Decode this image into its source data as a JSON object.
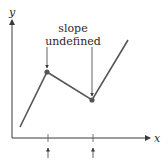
{
  "figure": {
    "axes": {
      "x_label": "x",
      "y_label": "y",
      "color": "#3a3a3a"
    },
    "annotation": {
      "line1": "slope",
      "line2": "undefined"
    },
    "curve": {
      "color": "#555555",
      "point_color": "#555555",
      "points": [
        {
          "x": 20,
          "y": 127
        },
        {
          "x": 47,
          "y": 72
        },
        {
          "x": 92,
          "y": 100
        },
        {
          "x": 128,
          "y": 40
        }
      ],
      "corners": [
        {
          "name": "local-max-corner",
          "x": 47,
          "y": 72
        },
        {
          "name": "local-min-corner",
          "x": 92,
          "y": 100
        }
      ]
    },
    "tick_marks": [
      48,
      93
    ]
  }
}
